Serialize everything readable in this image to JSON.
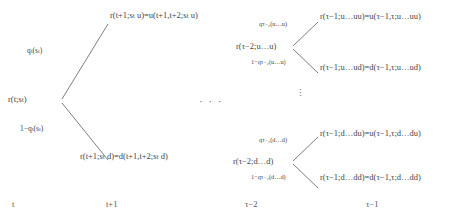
{
  "diagram": {
    "line_color": "#6f6f6f",
    "text_color": "#444444",
    "background": "#ffffff",
    "ellipsis_horizontal": "· · ·",
    "ellipsis_vertical": "⋮"
  },
  "left_block": {
    "root_node": "r(t;sₜ)",
    "up_probability": "qₜ(sₜ)",
    "down_probability": "1−qₜ(sₜ)",
    "up_leaf": "r(t+1;sₜ u)=u(t+1,t+2;sₜ u)",
    "down_leaf": "r(t+1;sₜ d)=d(t+1,t+2;sₜ d)"
  },
  "right_upper_block": {
    "root_node": "r(τ−2;u…u)",
    "up_probability": "qτ₋₂(u…u)",
    "down_probability": "1−qτ₋₂(u…u)",
    "up_leaf": "r(τ−1;u…uu)=u(τ−1,τ;u…uu)",
    "down_leaf": "r(τ−1;u…ud)=d(τ−1,τ;u…ud)"
  },
  "right_lower_block": {
    "root_node": "r(τ−2;d…d)",
    "up_probability": "qτ₋₂(d…d)",
    "down_probability": "1−qτ₋₂(d…d)",
    "up_leaf": "r(τ−1;d…du)=u(τ−1,τ;d…du)",
    "down_leaf": "r(τ−1;d…dd)=d(τ−1,τ;d…dd)"
  },
  "time_axis": {
    "ticks": [
      {
        "label": "t"
      },
      {
        "label": "t+1"
      },
      {
        "label": "τ−2"
      },
      {
        "label": "τ−1"
      }
    ]
  }
}
